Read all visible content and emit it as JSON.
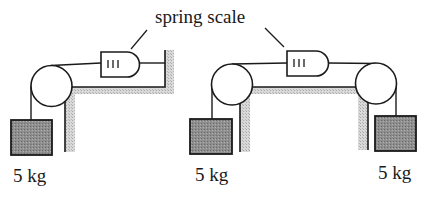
{
  "diagram": {
    "title_label": "spring scale",
    "left_setup": {
      "mass_label": "5 kg",
      "description": "Mass hangs over pulley; rope passes through spring scale to fixed wall"
    },
    "right_setup": {
      "left_mass_label": "5 kg",
      "right_mass_label": "5 kg",
      "description": "Two masses hang over two pulleys connected through a spring scale"
    },
    "colors": {
      "line": "#1a1a1a",
      "mass_fill": "#8a8a8a",
      "wall_hatch": "#c8c8c8"
    }
  }
}
